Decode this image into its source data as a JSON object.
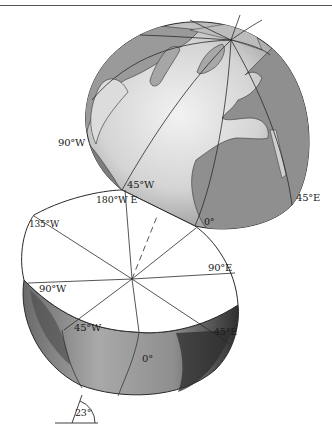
{
  "figure": {
    "upper_hemisphere": {
      "labels": {
        "lon_90w": "90°W",
        "lon_45w": "45°W",
        "lon_180": "180°W E",
        "lon_45e": "45°E",
        "lon_0": "0°"
      }
    },
    "equatorial_plane": {
      "labels": {
        "lon_135w": "135°W",
        "lon_90e": "90°E",
        "lon_90w": "90°W",
        "lon_45w": "45°W",
        "lon_45e": "45°E",
        "lon_0": "0°"
      }
    },
    "tilt": {
      "label": "23°"
    },
    "colors": {
      "ocean_light": "#e2e2e2",
      "ocean_mid": "#bdbdbd",
      "land": "#8f8f8f",
      "land_dark": "#5e5e5e",
      "line": "#2a2a2a",
      "plane": "#ffffff"
    }
  }
}
